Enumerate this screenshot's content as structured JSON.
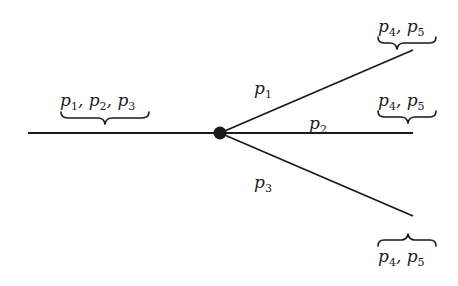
{
  "diagram": {
    "type": "branching-path",
    "node": {
      "x": 220,
      "y": 133,
      "r": 6,
      "color": "#1a1a1a"
    },
    "incoming": {
      "x1": 28,
      "y1": 133,
      "label": {
        "var": "p",
        "subs": [
          "1",
          "2",
          "3"
        ],
        "text": "p1, p2, p3",
        "brace": "under"
      }
    },
    "branches": [
      {
        "id": "upper",
        "label": {
          "var": "p",
          "sub": "1",
          "text": "p1"
        },
        "end": {
          "x": 413,
          "y": 50
        },
        "end_label": {
          "var": "p",
          "subs": [
            "4",
            "5"
          ],
          "text": "p4, p5",
          "brace": "under"
        }
      },
      {
        "id": "middle",
        "label": {
          "var": "p",
          "sub": "2",
          "text": "p2"
        },
        "end": {
          "x": 413,
          "y": 133
        },
        "end_label": {
          "var": "p",
          "subs": [
            "4",
            "5"
          ],
          "text": "p4, p5",
          "brace": "under"
        }
      },
      {
        "id": "lower",
        "label": {
          "var": "p",
          "sub": "3",
          "text": "p3"
        },
        "end": {
          "x": 413,
          "y": 216
        },
        "end_label": {
          "var": "p",
          "subs": [
            "4",
            "5"
          ],
          "text": "p4, p5",
          "brace": "over"
        }
      }
    ],
    "colors": {
      "ink": "#1a1a1a",
      "background": "#ffffff"
    }
  }
}
